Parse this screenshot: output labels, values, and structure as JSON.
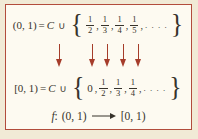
{
  "colors": {
    "page_bg": "#f1ead6",
    "panel_bg": "#fdfaf1",
    "border": "#b24c3c",
    "arrow": "#a53c2a",
    "text": "#37332b"
  },
  "top_equation": {
    "lhs": "(0, 1)",
    "equals": "=",
    "set_symbol": "C",
    "union": "∪",
    "open_brace": "{",
    "items": [
      {
        "num": "1",
        "den": "2"
      },
      {
        "num": "1",
        "den": "3"
      },
      {
        "num": "1",
        "den": "4"
      },
      {
        "num": "1",
        "den": "5"
      }
    ],
    "comma": ",",
    "ellipsis": ". . . .",
    "close_brace": "}"
  },
  "mapping_arrows": {
    "icon": "down-arrow",
    "count": 5
  },
  "bottom_equation": {
    "lhs": "[0, 1)",
    "equals": "=",
    "set_symbol": "C",
    "union": "∪",
    "open_brace": "{",
    "zero": "0",
    "items": [
      {
        "num": "1",
        "den": "2"
      },
      {
        "num": "1",
        "den": "3"
      },
      {
        "num": "1",
        "den": "4"
      }
    ],
    "comma": ",",
    "ellipsis": ". . . .",
    "close_brace": "}"
  },
  "function_line": {
    "f": "f",
    "colon": ":",
    "domain": "(0, 1)",
    "arrow_icon": "long-right-arrow",
    "codomain": "[0, 1)"
  }
}
